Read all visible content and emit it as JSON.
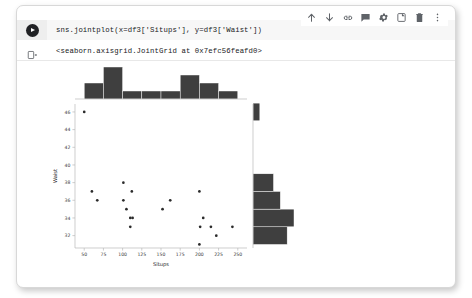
{
  "notebook": {
    "toolbar": {
      "items": [
        {
          "name": "move-cell-up-icon",
          "label": "Move cell up"
        },
        {
          "name": "move-cell-down-icon",
          "label": "Move cell down"
        },
        {
          "name": "link-to-cell-icon",
          "label": "Link to cell"
        },
        {
          "name": "add-comment-icon",
          "label": "Add comment"
        },
        {
          "name": "cell-settings-icon",
          "label": "Settings"
        },
        {
          "name": "mirror-cell-icon",
          "label": "Mirror cell in tab"
        },
        {
          "name": "delete-cell-icon",
          "label": "Delete cell"
        },
        {
          "name": "more-options-icon",
          "label": "More cell actions"
        }
      ]
    },
    "input_cell": {
      "run_button_label": "Run cell",
      "code": "sns.jointplot(x=df3['Situps'], y=df3['Waist'])"
    },
    "output_cell": {
      "output_icon_name": "output-stream-icon",
      "text": "<seaborn.axisgrid.JointGrid at 0x7efc56feafd0>"
    }
  },
  "chart_data": {
    "type": "scatter",
    "title": "",
    "xlabel": "Situps",
    "ylabel": "Waist",
    "xlim": [
      38,
      262
    ],
    "ylim": [
      30.6,
      46.9
    ],
    "xticks": [
      50,
      75,
      100,
      125,
      150,
      175,
      200,
      225,
      250
    ],
    "yticks": [
      32,
      34,
      36,
      38,
      40,
      42,
      44,
      46
    ],
    "grid": false,
    "legend": null,
    "marker": "point",
    "marker_color": "#2b2b2b",
    "points": [
      {
        "x": 50,
        "y": 46
      },
      {
        "x": 60,
        "y": 37
      },
      {
        "x": 67,
        "y": 36
      },
      {
        "x": 101,
        "y": 38
      },
      {
        "x": 101,
        "y": 36
      },
      {
        "x": 105,
        "y": 35
      },
      {
        "x": 110,
        "y": 34
      },
      {
        "x": 113,
        "y": 34
      },
      {
        "x": 110,
        "y": 33
      },
      {
        "x": 112,
        "y": 37
      },
      {
        "x": 152,
        "y": 35
      },
      {
        "x": 162,
        "y": 36
      },
      {
        "x": 200,
        "y": 37
      },
      {
        "x": 205,
        "y": 34
      },
      {
        "x": 201,
        "y": 33
      },
      {
        "x": 215,
        "y": 33
      },
      {
        "x": 222,
        "y": 32
      },
      {
        "x": 200,
        "y": 31
      },
      {
        "x": 243,
        "y": 33
      }
    ],
    "marginal_x": {
      "type": "bar",
      "orientation": "vertical",
      "bin_edges": [
        50,
        75,
        100,
        125,
        150,
        175,
        200,
        225,
        250
      ],
      "counts": [
        2,
        4,
        1,
        1,
        1,
        3,
        2,
        1
      ]
    },
    "marginal_y": {
      "type": "bar",
      "orientation": "horizontal",
      "bin_edges": [
        31,
        33,
        35,
        37,
        39,
        41,
        43,
        45,
        47
      ],
      "counts": [
        5,
        6,
        4,
        3,
        0,
        0,
        0,
        1
      ]
    }
  }
}
